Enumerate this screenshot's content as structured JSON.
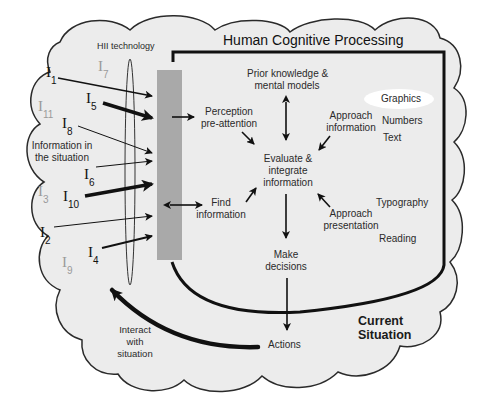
{
  "diagram": {
    "title": "Human Cognitive Processing",
    "technology_label": "HII technology",
    "situation_label": "Information in the situation",
    "situation_label_lines": [
      "Information in",
      "the situation"
    ],
    "current_situation_lines": [
      "Current",
      "Situation"
    ],
    "interact_lines": [
      "Interact",
      "with",
      "situation"
    ],
    "information_items": [
      {
        "id": "I1",
        "base": "I",
        "sub": "1",
        "faded": false
      },
      {
        "id": "I2",
        "base": "I",
        "sub": "2",
        "faded": false
      },
      {
        "id": "I3",
        "base": "I",
        "sub": "3",
        "faded": true
      },
      {
        "id": "I4",
        "base": "I",
        "sub": "4",
        "faded": false
      },
      {
        "id": "I5",
        "base": "I",
        "sub": "5",
        "faded": false
      },
      {
        "id": "I6",
        "base": "I",
        "sub": "6",
        "faded": false
      },
      {
        "id": "I7",
        "base": "I",
        "sub": "7",
        "faded": true
      },
      {
        "id": "I8",
        "base": "I",
        "sub": "8",
        "faded": false
      },
      {
        "id": "I9",
        "base": "I",
        "sub": "9",
        "faded": true
      },
      {
        "id": "I10",
        "base": "I",
        "sub": "10",
        "faded": false
      },
      {
        "id": "I11",
        "base": "I",
        "sub": "11",
        "faded": true
      }
    ],
    "nodes": {
      "prior_knowledge": [
        "Prior knowledge &",
        "mental models"
      ],
      "perception": [
        "Perception",
        "pre-attention"
      ],
      "approach_information": [
        "Approach",
        "information"
      ],
      "evaluate": [
        "Evaluate &",
        "integrate",
        "information"
      ],
      "find_information": [
        "Find",
        "information"
      ],
      "approach_presentation": [
        "Approach",
        "presentation"
      ],
      "make_decisions": [
        "Make",
        "decisions"
      ],
      "actions": "Actions"
    },
    "information_types": [
      "Graphics",
      "Numbers",
      "Text"
    ],
    "presentation_types": [
      "Typography",
      "Reading"
    ],
    "colors": {
      "cloud_fill": "#ececec",
      "cloud_stroke": "#2a2a2a",
      "tech_bar": "#a9a9a9",
      "line": "#111111",
      "faded_text": "#9a9a9a",
      "highlight": "#ffffff"
    }
  }
}
